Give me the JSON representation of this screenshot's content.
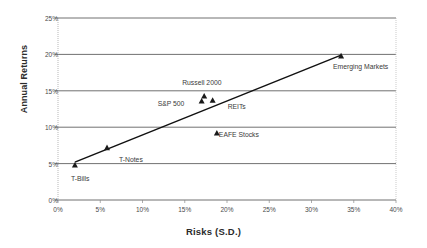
{
  "chart_data": {
    "type": "scatter",
    "title": "",
    "xlabel": "Risks (S.D.)",
    "ylabel": "Annual Returns",
    "xlim": [
      0,
      40
    ],
    "ylim": [
      0,
      25
    ],
    "xticks": [
      "0%",
      "5%",
      "10%",
      "15%",
      "20%",
      "25%",
      "30%",
      "35%",
      "40%"
    ],
    "xtick_values": [
      0,
      5,
      10,
      15,
      20,
      25,
      30,
      35,
      40
    ],
    "yticks": [
      "0%",
      "5%",
      "10%",
      "15%",
      "20%",
      "25%"
    ],
    "ytick_values": [
      0,
      5,
      10,
      15,
      20,
      25
    ],
    "grid": "horizontal",
    "legend": "none",
    "marker": "triangle",
    "marker_color": "#1a1a1a",
    "trendline": {
      "visible": true,
      "color": "#111111",
      "from": [
        2.0,
        5.2
      ],
      "to": [
        33.5,
        19.9
      ]
    },
    "points": [
      {
        "name": "T-Bills",
        "x": 2.0,
        "y": 4.8,
        "label": "T-Bills",
        "label_dx": -4,
        "label_dy": 14
      },
      {
        "name": "T-Notes",
        "x": 5.8,
        "y": 7.2,
        "label": "T-Notes",
        "label_dx": 12,
        "label_dy": 12
      },
      {
        "name": "S&P 500",
        "x": 17.0,
        "y": 13.6,
        "label": "S&P 500",
        "label_dx": -44,
        "label_dy": 3
      },
      {
        "name": "Russell 2000",
        "x": 17.3,
        "y": 14.3,
        "label": "Russell 2000",
        "label_dx": -22,
        "label_dy": -13
      },
      {
        "name": "REITs",
        "x": 18.3,
        "y": 13.7,
        "label": "REITs",
        "label_dx": 15,
        "label_dy": 7
      },
      {
        "name": "EAFE Stocks",
        "x": 18.8,
        "y": 9.2,
        "label": "EAFE Stocks",
        "label_dx": 2,
        "label_dy": 2
      },
      {
        "name": "Emerging Markets",
        "x": 33.5,
        "y": 19.8,
        "label": "Emerging Markets",
        "label_dx": -8,
        "label_dy": 11
      }
    ]
  }
}
